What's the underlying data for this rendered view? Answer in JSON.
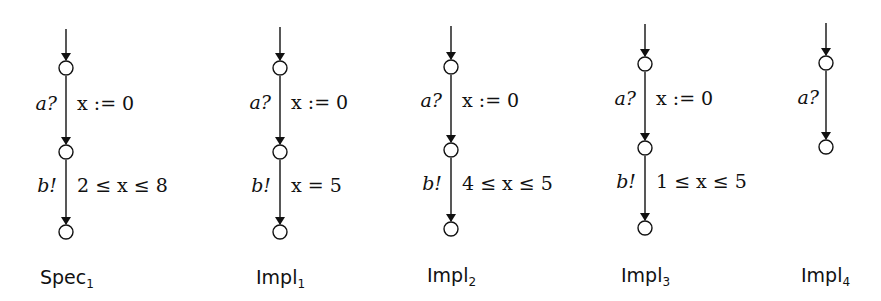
{
  "automata": [
    {
      "name": "Spec",
      "index": "1",
      "x": 66,
      "states_y": [
        68,
        152,
        232
      ],
      "entry_top": 29,
      "transitions": [
        {
          "action": "a?",
          "label": "x := 0"
        },
        {
          "action": "b!",
          "label": "2 ≤ x ≤ 8"
        }
      ]
    },
    {
      "name": "Impl",
      "index": "1",
      "x": 280,
      "states_y": [
        68,
        152,
        232
      ],
      "entry_top": 27,
      "transitions": [
        {
          "action": "a?",
          "label": "x := 0"
        },
        {
          "action": "b!",
          "label": "x = 5"
        }
      ]
    },
    {
      "name": "Impl",
      "index": "2",
      "x": 451,
      "states_y": [
        67,
        150,
        229
      ],
      "entry_top": 26,
      "transitions": [
        {
          "action": "a?",
          "label": "x := 0"
        },
        {
          "action": "b!",
          "label": "4 ≤ x ≤ 5"
        }
      ]
    },
    {
      "name": "Impl",
      "index": "3",
      "x": 645,
      "states_y": [
        64,
        148,
        228
      ],
      "entry_top": 24,
      "transitions": [
        {
          "action": "a?",
          "label": "x := 0"
        },
        {
          "action": "b!",
          "label": "1 ≤ x ≤ 5"
        }
      ]
    },
    {
      "name": "Impl",
      "index": "4",
      "x": 826,
      "states_y": [
        63,
        147
      ],
      "entry_top": 23,
      "transitions": [
        {
          "action": "a?",
          "label": ""
        }
      ]
    }
  ],
  "captions": {
    "spec1": {
      "name": "Spec",
      "index": "1"
    },
    "impl1": {
      "name": "Impl",
      "index": "1"
    },
    "impl2": {
      "name": "Impl",
      "index": "2"
    },
    "impl3": {
      "name": "Impl",
      "index": "3"
    },
    "impl4": {
      "name": "Impl",
      "index": "4"
    }
  }
}
